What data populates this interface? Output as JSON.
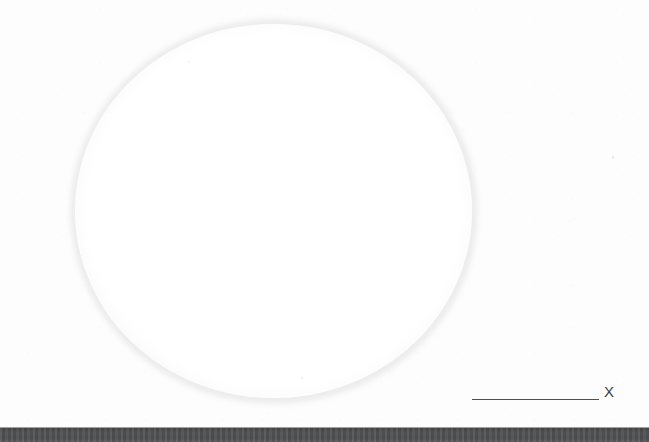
{
  "figure": {
    "kind": "scanned-micrograph",
    "caption_text": "",
    "background_color": "#fdfdfd"
  },
  "droplet": {
    "name": "sphere",
    "fill_color": "#ffffff",
    "edge_color": "#bcbcbc",
    "center_x": 273,
    "center_y": 211,
    "diameter_px": 397
  },
  "scale_bar": {
    "label": "X",
    "line_color": "#4f5153",
    "length_px": 127
  },
  "substrate": {
    "label": "",
    "color": "#4c4c4e",
    "height_px": 14
  },
  "chart_data": {
    "type": "scatter",
    "title": "",
    "xlabel": "",
    "ylabel": "",
    "annotations": [
      "X"
    ],
    "series": [
      {
        "name": "sphere",
        "x": [
          273
        ],
        "y": [
          211
        ],
        "radius": [
          198.5
        ]
      }
    ],
    "xlim": [
      0,
      649
    ],
    "ylim": [
      0,
      442
    ],
    "grid": false,
    "legend": "none"
  }
}
